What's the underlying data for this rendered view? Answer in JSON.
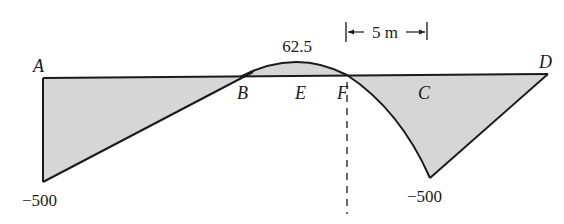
{
  "diagram": {
    "type": "bending-moment-diagram",
    "points": {
      "A": "A",
      "B": "B",
      "E": "E",
      "F": "F",
      "C": "C",
      "D": "D"
    },
    "values": {
      "left_min": "−500",
      "peak": "62.5",
      "right_min": "−500"
    },
    "dimension": {
      "label": "5 m"
    },
    "colors": {
      "fill": "#d4d4d4",
      "stroke": "#1a1a1a"
    }
  }
}
